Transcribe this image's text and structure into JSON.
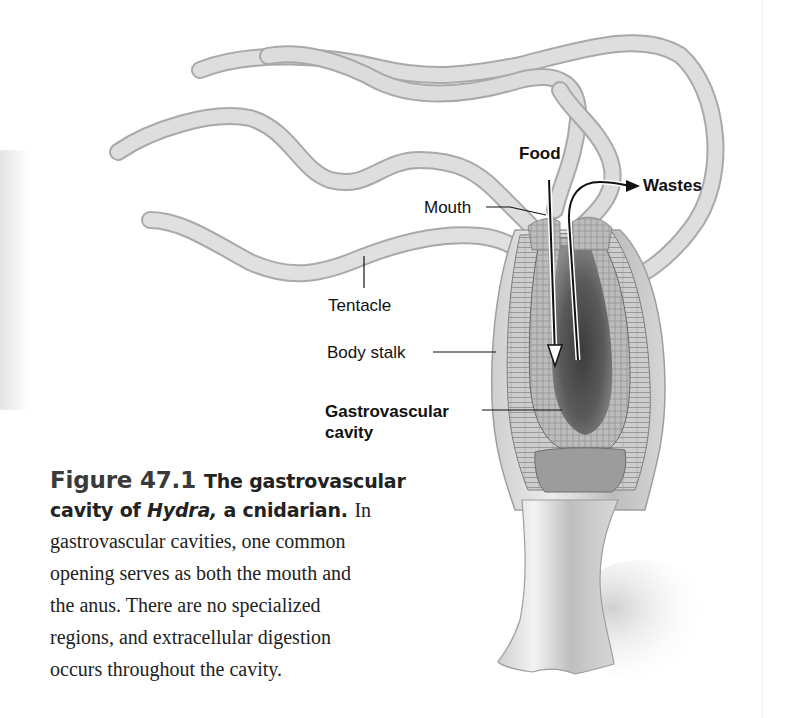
{
  "figure": {
    "number": "Figure 47.1",
    "title_part1": "The gastrovascular cavity of ",
    "title_italic": "Hydra,",
    "title_part2": " a cnidarian.",
    "lead_word": "In",
    "body_lines": [
      "gastrovascular cavities, one common",
      "opening serves as both the mouth and",
      "the anus. There are no specialized",
      "regions, and extracellular digestion",
      "occurs throughout the cavity."
    ]
  },
  "labels": {
    "food": "Food",
    "wastes": "Wastes",
    "mouth": "Mouth",
    "tentacle": "Tentacle",
    "body_stalk": "Body stalk",
    "gastrovascular_line1": "Gastrovascular",
    "gastrovascular_line2": "cavity"
  },
  "colors": {
    "tentacle_fill": "#d9d9d9",
    "tentacle_edge": "#a8a8a8",
    "cavity_dark": "#4a4a4a",
    "tissue": "#b5b5b5",
    "label_text": "#111111"
  }
}
